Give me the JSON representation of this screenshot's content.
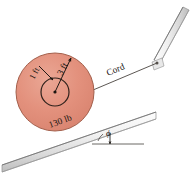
{
  "figure": {
    "labels": {
      "outer_radius": "3 ft",
      "inner_radius": "1 ft",
      "weight": "130 lb",
      "cord": "Cord",
      "angle": "ϕ"
    },
    "colors": {
      "wheel_fill": "#e3917d",
      "wheel_fill_light": "#eaa592",
      "wheel_edge": "#9a5a48",
      "hub_edge": "#3a2a22",
      "rail_face": "#f2f2f2",
      "rail_shade": "#cfcfcf",
      "rail_edge": "#8c8c8c",
      "line": "#2a2420",
      "background": "#ffffff"
    },
    "geometry": {
      "wheel_center_x": 55,
      "wheel_center_y": 92,
      "outer_radius_px": 39,
      "inner_radius_px": 14,
      "incline_angle_deg": 19,
      "cord_anchor_x": 160,
      "cord_anchor_y": 62
    }
  }
}
